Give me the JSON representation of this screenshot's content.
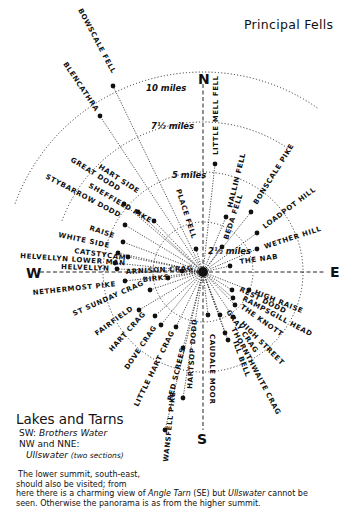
{
  "title": "Principal Fells",
  "compass": {
    "n": "N",
    "s": "S",
    "e": "E",
    "w": "W"
  },
  "summit": {
    "x": 203,
    "y": 272
  },
  "rings": [
    {
      "label": "2½ miles",
      "r": 50
    },
    {
      "label": "5 miles",
      "r": 100
    },
    {
      "label": "7½ miles",
      "r": 150
    },
    {
      "label": "10 miles",
      "r": 200
    }
  ],
  "fells": [
    {
      "name": "BOWSCALE FELL",
      "x": 113,
      "y": 86
    },
    {
      "name": "BLENCATHRA",
      "x": 100,
      "y": 116
    },
    {
      "name": "LITTLE MELL FELL",
      "x": 215,
      "y": 164
    },
    {
      "name": "HALLIN FELL",
      "x": 226,
      "y": 217
    },
    {
      "name": "BONSCALE PIKE",
      "x": 251,
      "y": 212
    },
    {
      "name": "LOADPOT HILL",
      "x": 257,
      "y": 233
    },
    {
      "name": "WETHER HILL",
      "x": 257,
      "y": 249
    },
    {
      "name": "BEDA FELL",
      "x": 222,
      "y": 247
    },
    {
      "name": "PLACE FELL",
      "x": 196,
      "y": 249
    },
    {
      "name": "THE NAB",
      "x": 230,
      "y": 266
    },
    {
      "name": "HART SIDE",
      "x": 124,
      "y": 204
    },
    {
      "name": "GREAT DODD",
      "x": 138,
      "y": 212
    },
    {
      "name": "SHEFFIELD PIKE",
      "x": 154,
      "y": 221
    },
    {
      "name": "STYBARROW DODD",
      "x": 125,
      "y": 225
    },
    {
      "name": "RAISE",
      "x": 123,
      "y": 242
    },
    {
      "name": "WHITE SIDE",
      "x": 118,
      "y": 253
    },
    {
      "name": "CATSTYCAM",
      "x": 128,
      "y": 257
    },
    {
      "name": "HELVELLYN LOWER MAN",
      "x": 115,
      "y": 263
    },
    {
      "name": "HELVELLYN",
      "x": 117,
      "y": 269
    },
    {
      "name": "ARNISON CRAG",
      "x": 182,
      "y": 271
    },
    {
      "name": "BIRKS",
      "x": 168,
      "y": 278
    },
    {
      "name": "NETHERMOST PIKE",
      "x": 125,
      "y": 281
    },
    {
      "name": "ST SUNDAY CRAG",
      "x": 150,
      "y": 290
    },
    {
      "name": "FAIRFIELD",
      "x": 139,
      "y": 310
    },
    {
      "name": "HART CRAG",
      "x": 155,
      "y": 316
    },
    {
      "name": "DOVE CRAG",
      "x": 161,
      "y": 325
    },
    {
      "name": "LITTLE HART CRAG",
      "x": 176,
      "y": 327
    },
    {
      "name": "RED SCREES",
      "x": 183,
      "y": 398
    },
    {
      "name": "HARTSOP DODD",
      "x": 183,
      "y": 348
    },
    {
      "name": "CAUDALE MOOR",
      "x": 208,
      "y": 315
    },
    {
      "name": "WANSFELL PIKE",
      "x": 165,
      "y": 430
    },
    {
      "name": "THORNTHWAITE CRAG",
      "x": 225,
      "y": 333
    },
    {
      "name": "ILL BELL",
      "x": 228,
      "y": 340
    },
    {
      "name": "GRAY CRAG",
      "x": 220,
      "y": 315
    },
    {
      "name": "HIGH STREET",
      "x": 233,
      "y": 317
    },
    {
      "name": "THE KNOTT",
      "x": 235,
      "y": 305
    },
    {
      "name": "RAMPSGILL HEAD",
      "x": 233,
      "y": 298
    },
    {
      "name": "REST DODD",
      "x": 232,
      "y": 290
    },
    {
      "name": "HIGH RAISE",
      "x": 249,
      "y": 290
    }
  ],
  "labels": [
    {
      "key": "bowscale",
      "text": "BOWSCALE FELL",
      "x": 78,
      "y": 10,
      "rot": 62
    },
    {
      "key": "blencathra",
      "text": "BLENCATHRA",
      "x": 63,
      "y": 64,
      "rot": 56
    },
    {
      "key": "littlemell",
      "text": "LITTLE MELL FELL",
      "x": 218,
      "y": 155,
      "rot": -90
    },
    {
      "key": "hallin",
      "text": "HALLIN FELL",
      "x": 232,
      "y": 208,
      "rot": -76
    },
    {
      "key": "bonscale",
      "text": "BONSCALE PIKE",
      "x": 257,
      "y": 205,
      "rot": -58
    },
    {
      "key": "loadpot",
      "text": "LOADPOT HILL",
      "x": 265,
      "y": 229,
      "rot": -37
    },
    {
      "key": "wether",
      "text": "WETHER HILL",
      "x": 265,
      "y": 249,
      "rot": -18
    },
    {
      "key": "beda",
      "text": "BEDA FELL",
      "x": 228,
      "y": 240,
      "rot": -72
    },
    {
      "key": "place",
      "text": "PLACE FELL",
      "x": 176,
      "y": 190,
      "rot": 72
    },
    {
      "key": "thenab",
      "text": "THE NAB",
      "x": 240,
      "y": 264,
      "rot": -8
    },
    {
      "key": "hartside",
      "text": "HART SIDE",
      "x": 98,
      "y": 168,
      "rot": 33
    },
    {
      "key": "greatdodd",
      "text": "GREAT DODD",
      "x": 70,
      "y": 161,
      "rot": 32
    },
    {
      "key": "sheffield",
      "text": "SHEFFIELD PIKE",
      "x": 88,
      "y": 187,
      "rot": 30
    },
    {
      "key": "stybarrow",
      "text": "STYBARROW DODD",
      "x": 45,
      "y": 178,
      "rot": 28
    },
    {
      "key": "raise",
      "text": "RAISE",
      "x": 89,
      "y": 230,
      "rot": 18
    },
    {
      "key": "whiteside",
      "text": "WHITE SIDE",
      "x": 58,
      "y": 237,
      "rot": 12
    },
    {
      "key": "catstycam",
      "text": "CATSTYCAM",
      "x": 74,
      "y": 253,
      "rot": 8
    },
    {
      "key": "helvlower",
      "text": "HELVELLYN LOWER MAN",
      "x": 20,
      "y": 258,
      "rot": 4
    },
    {
      "key": "helvellyn",
      "text": "HELVELLYN",
      "x": 61,
      "y": 269,
      "rot": 2
    },
    {
      "key": "arnison",
      "text": "ARNISON CRAG",
      "x": 126,
      "y": 274,
      "rot": -3
    },
    {
      "key": "birks",
      "text": "BIRKS",
      "x": 143,
      "y": 282,
      "rot": -6
    },
    {
      "key": "nethermost",
      "text": "NETHERMOST PIKE",
      "x": 33,
      "y": 295,
      "rot": -6
    },
    {
      "key": "stsunday",
      "text": "ST SUNDAY CRAG",
      "x": 74,
      "y": 316,
      "rot": -24
    },
    {
      "key": "fairfield",
      "text": "FAIRFIELD",
      "x": 97,
      "y": 336,
      "rot": -36
    },
    {
      "key": "hartcrag",
      "text": "HART CRAG",
      "x": 112,
      "y": 352,
      "rot": -48
    },
    {
      "key": "dovecrag",
      "text": "DOVE CRAG",
      "x": 128,
      "y": 370,
      "rot": -56
    },
    {
      "key": "littlehart",
      "text": "LITTLE HART CRAG",
      "x": 138,
      "y": 407,
      "rot": -64
    },
    {
      "key": "redscrees",
      "text": "RED SCREES",
      "x": 172,
      "y": 401,
      "rot": -76
    },
    {
      "key": "hartsop",
      "text": "HARTSOP DODD",
      "x": 192,
      "y": 389,
      "rot": -86
    },
    {
      "key": "caudale",
      "text": "CAUDALE MOOR",
      "x": 210,
      "y": 334,
      "rot": 90
    },
    {
      "key": "wansfell",
      "text": "WANSFELL PIKE",
      "x": 168,
      "y": 462,
      "rot": -84
    },
    {
      "key": "thornthwaite",
      "text": "THORNTHWAITE CRAG",
      "x": 231,
      "y": 329,
      "rot": 62
    },
    {
      "key": "illbell",
      "text": "ILL BELL",
      "x": 233,
      "y": 342,
      "rot": 70
    },
    {
      "key": "graycrag",
      "text": "GRAY CRAG",
      "x": 226,
      "y": 312,
      "rot": 55
    },
    {
      "key": "highstreet",
      "text": "HIGH STREET",
      "x": 240,
      "y": 324,
      "rot": 45
    },
    {
      "key": "theknott",
      "text": "THE KNOTT",
      "x": 240,
      "y": 308,
      "rot": 35
    },
    {
      "key": "rampsgill",
      "text": "RAMPSGILL HEAD",
      "x": 242,
      "y": 300,
      "rot": 28
    },
    {
      "key": "restdodd",
      "text": "REST DODD",
      "x": 239,
      "y": 291,
      "rot": 26
    },
    {
      "key": "highraise",
      "text": "HIGH RAISE",
      "x": 254,
      "y": 294,
      "rot": 22
    }
  ],
  "lakes": {
    "heading": "Lakes and Tarns",
    "rows": [
      {
        "dir": "SW:",
        "name": "Brothers Water",
        "note": ""
      },
      {
        "dir": "NW and NNE:",
        "name": "",
        "note": ""
      },
      {
        "dir": "",
        "name": "Ullswater",
        "note": "(two sections)"
      }
    ]
  },
  "note": {
    "line1": "The lower summit, south-east,",
    "line2": "should also be visited; from",
    "line3_a": "here there is a charming view of ",
    "line3_tarn": "Angle Tarn",
    "line3_b": " (SE) but ",
    "line3_lake": "Ullswater",
    "line3_c": " cannot be",
    "line4": "seen. Otherwise the panorama is as from the higher summit."
  }
}
